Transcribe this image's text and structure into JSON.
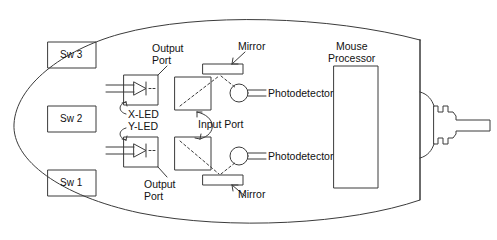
{
  "figure": {
    "title_present": false,
    "kind": "optical-mouse-internal-schematic",
    "background_color": "#ffffff",
    "line_color": "#3b3b3b",
    "text_color": "#111111"
  },
  "body_outline": {
    "name": "mouse-body-outline",
    "shape": "rounded teardrop / oval with flat right edge"
  },
  "switches": [
    {
      "label": "Sw 3",
      "x": 48,
      "y": 42,
      "w": 48,
      "h": 26
    },
    {
      "label": "Sw 2",
      "x": 48,
      "y": 106,
      "w": 48,
      "h": 26
    },
    {
      "label": "Sw 1",
      "x": 48,
      "y": 170,
      "w": 48,
      "h": 26
    }
  ],
  "leds": [
    {
      "label": "X-LED",
      "x": 124,
      "y": 75,
      "w": 34,
      "h": 30
    },
    {
      "label": "Y-LED",
      "x": 124,
      "y": 137,
      "w": 34,
      "h": 30
    }
  ],
  "ports": {
    "output_top": "Output\nPort",
    "output_top_line1": "Output",
    "output_top_line2": "Port",
    "output_bottom_line1": "Output",
    "output_bottom_line2": "Port",
    "input": "Input Port"
  },
  "sensor_boxes": [
    {
      "name": "sensor-box-top",
      "x": 175,
      "y": 77,
      "w": 36,
      "h": 33
    },
    {
      "name": "sensor-box-bottom",
      "x": 175,
      "y": 137,
      "w": 36,
      "h": 33
    }
  ],
  "mirrors": [
    {
      "label": "Mirror",
      "x": 203,
      "y": 64,
      "w": 40,
      "h": 10
    },
    {
      "label": "Mirror",
      "x": 203,
      "y": 175,
      "w": 40,
      "h": 10
    }
  ],
  "photodetectors": [
    {
      "label": "Photodetector",
      "cx": 239,
      "cy": 93,
      "r": 9
    },
    {
      "label": "Photodetector",
      "cx": 239,
      "cy": 156,
      "r": 9
    }
  ],
  "processor": {
    "label_line1": "Mouse",
    "label_line2": "Processor",
    "box": {
      "x": 334,
      "y": 66,
      "w": 44,
      "h": 122
    }
  },
  "cable": {
    "name": "mouse-cable",
    "description": "strain relief and cord exiting right side"
  },
  "labels": {
    "mirror": "Mirror",
    "photodetector": "Photodetector",
    "x_led": "X-LED",
    "y_led": "Y-LED",
    "input_port": "Input Port"
  }
}
